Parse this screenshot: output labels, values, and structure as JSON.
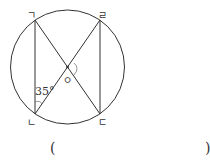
{
  "figure": {
    "labels": {
      "top_left": "ㄱ",
      "top_right": "ㄹ",
      "bottom_left": "ㄴ",
      "bottom_right": "ㄷ",
      "center": "ㅇ"
    },
    "angle_label": "35°"
  },
  "answer": {
    "open_paren": "(",
    "close_paren": ")"
  },
  "colors": {
    "stroke": "#333333",
    "arc": "#777777"
  }
}
